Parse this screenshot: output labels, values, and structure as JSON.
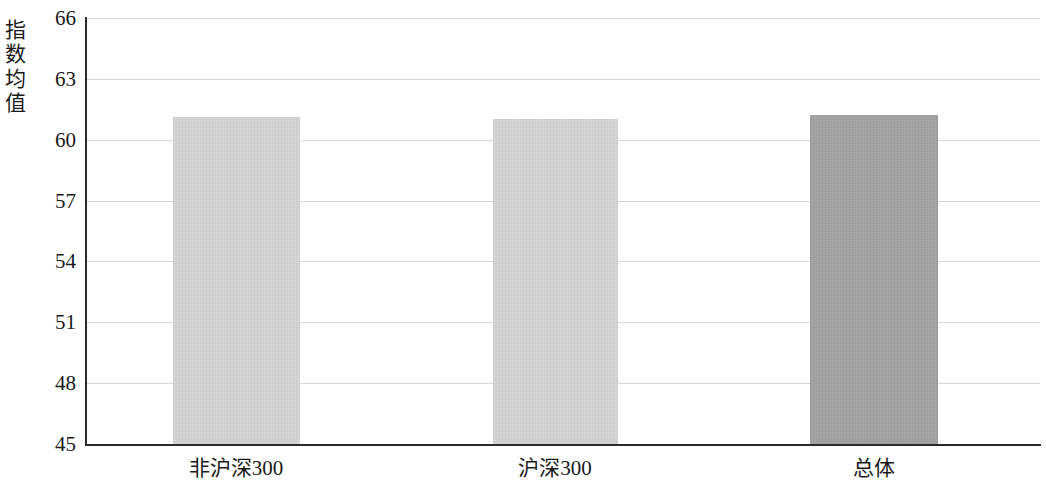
{
  "chart_data": {
    "type": "bar",
    "title": "",
    "subtitle": "",
    "xlabel": "",
    "ylabel": "指数均值",
    "categories": [
      "非沪深300",
      "沪深300",
      "总体"
    ],
    "values": [
      61.1,
      61.0,
      61.2
    ],
    "series": [
      {
        "name": "指数均值",
        "values": [
          61.1,
          61.0,
          61.2
        ]
      }
    ],
    "ylim": [
      45,
      66
    ],
    "y_ticks": [
      66,
      63,
      60,
      57,
      54,
      51,
      48,
      45
    ],
    "y_tick_labels": [
      "66",
      "63",
      "60",
      "57",
      "54",
      "51",
      "48",
      "45"
    ],
    "grid": true,
    "grid_axis": "y",
    "legend": false,
    "legend_position": "none",
    "bar_colors": [
      "#d5d5d5",
      "#d5d5d5",
      "#a2a2a2"
    ],
    "annotations": []
  },
  "axis": {
    "y_title_chars": "指\n数\n均\n值"
  },
  "colors": {
    "bar_light": "#d5d5d5",
    "bar_dark": "#a2a2a2",
    "gridline": "#d9d9d9",
    "axis": "#2b2b2b",
    "text": "#1a1a1a",
    "background": "#ffffff"
  },
  "geometry": {
    "plot_left": 85,
    "plot_top": 18,
    "plot_width": 955,
    "plot_height": 426,
    "bars": [
      {
        "left": 88,
        "width": 127
      },
      {
        "left": 408,
        "width": 125
      },
      {
        "left": 725,
        "width": 128
      }
    ],
    "x_label_centers": [
      236,
      555,
      874
    ]
  }
}
